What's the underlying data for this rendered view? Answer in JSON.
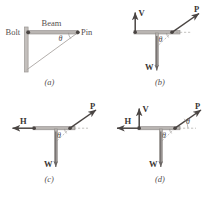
{
  "figure": {
    "panels": [
      {
        "id": "a",
        "caption": "(a)",
        "labels": {
          "bolt": "Bolt",
          "beam": "Beam",
          "pin": "Pin",
          "theta": "θ"
        },
        "description": "Wall-mounted beam with bolt at wall, pin at right end, diagonal brace"
      },
      {
        "id": "b",
        "caption": "(b)",
        "labels": {
          "v": "V",
          "p": "P",
          "w": "W",
          "theta": "θ"
        },
        "description": "Free body with vertical reaction V, applied force P, weight W"
      },
      {
        "id": "c",
        "caption": "(c)",
        "labels": {
          "h": "H",
          "p": "P",
          "w": "W",
          "theta": "θ"
        },
        "description": "Free body with horizontal reaction H, applied force P, weight W"
      },
      {
        "id": "d",
        "caption": "(d)",
        "labels": {
          "h": "H",
          "v": "V",
          "p": "P",
          "w": "W",
          "theta1": "θ",
          "theta2": "θ"
        },
        "description": "Free body with H, V, P and W plus two marked angles"
      }
    ],
    "colors": {
      "beam_fill": "#b9b5b2",
      "beam_edge": "#8d8986",
      "vector": "#4a4543",
      "dashed": "#9b9794",
      "text_bold": "#3a3634",
      "text_plain": "#55504f",
      "background": "#ffffff"
    }
  }
}
